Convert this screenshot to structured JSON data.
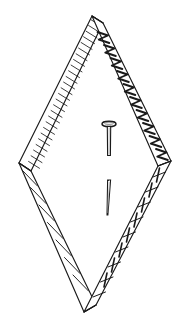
{
  "figure": {
    "style": "patent-style ink line art",
    "background_color": "#ffffff",
    "stroke_color": "#1a1a1a",
    "fill_color": "#ffffff",
    "canvas": {
      "width": 188,
      "height": 332
    }
  },
  "cropped_caption": {
    "text": "· · · ·",
    "note": "faint partially cropped text at very top edge"
  },
  "geometry": {
    "vertices": {
      "top": {
        "x": 92,
        "y": 16
      },
      "left": {
        "x": 19,
        "y": 163
      },
      "right": {
        "x": 171,
        "y": 161
      },
      "bottom": {
        "x": 84,
        "y": 312
      }
    },
    "band_width": 15
  },
  "bands": [
    {
      "id": "upper-left-band",
      "name": "upper-left-rail",
      "hatch": "close-parallel-rungs",
      "rungs": 26,
      "from": "top",
      "to": "left"
    },
    {
      "id": "upper-right-band",
      "name": "upper-right-rail",
      "hatch": "zigzag-diagonal",
      "rungs": 11,
      "from": "top",
      "to": "right"
    },
    {
      "id": "lower-left-band",
      "name": "lower-left-rail",
      "hatch": "sparse-long-diagonal",
      "rungs": 7,
      "from": "left",
      "to": "bottom"
    },
    {
      "id": "lower-right-band",
      "name": "lower-right-rail",
      "hatch": "ladder-with-cross-ticks",
      "rungs": 9,
      "from": "right",
      "to": "bottom"
    }
  ],
  "nails": [
    {
      "id": "upper-nail",
      "name": "headed-nail",
      "has_head": true,
      "head_shape": "flat-oval",
      "head_center": {
        "x": 109,
        "y": 124
      },
      "head_rx": 7,
      "head_ry": 2.6,
      "shaft_top": {
        "x": 109,
        "y": 127
      },
      "shaft_bottom": {
        "x": 109,
        "y": 155
      },
      "shaft_width": 3.4
    },
    {
      "id": "lower-nail",
      "name": "tapered-nail",
      "has_head": false,
      "head_shape": "none",
      "shaft_top": {
        "x": 109,
        "y": 180
      },
      "shaft_bottom": {
        "x": 107,
        "y": 215
      },
      "shaft_width_top": 3.0,
      "shaft_width_bottom": 1.2
    }
  ]
}
